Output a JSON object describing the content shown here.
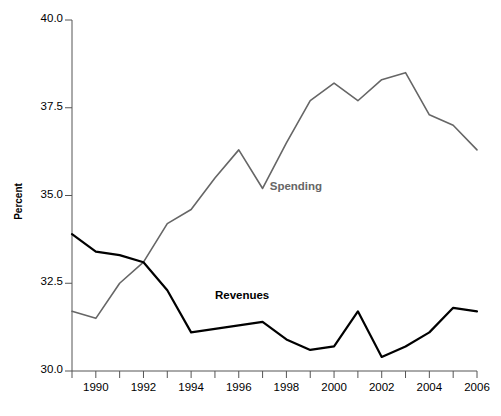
{
  "chart_data": {
    "type": "line",
    "title": "",
    "xlabel": "",
    "ylabel": "Percent",
    "ylim": [
      30.0,
      40.0
    ],
    "xlim": [
      1989,
      2006
    ],
    "grid": false,
    "legend_position": "inline-annotation",
    "ytick_labels": [
      "40.0",
      "37.5",
      "35.0",
      "32.5",
      "30.0"
    ],
    "ytick_values": [
      40.0,
      37.5,
      35.0,
      32.5,
      30.0
    ],
    "xtick_labels": [
      "1990",
      "1992",
      "1994",
      "1996",
      "1998",
      "2000",
      "2002",
      "2004",
      "2006"
    ],
    "xtick_values": [
      1990,
      1992,
      1994,
      1996,
      1998,
      2000,
      2002,
      2004,
      2006
    ],
    "x": [
      1989,
      1990,
      1991,
      1992,
      1993,
      1994,
      1995,
      1996,
      1997,
      1998,
      1999,
      2000,
      2001,
      2002,
      2003,
      2004,
      2005,
      2006
    ],
    "series": [
      {
        "name": "Spending",
        "color": "#666666",
        "label_color": "#666666",
        "values": [
          31.7,
          31.5,
          32.5,
          33.1,
          34.2,
          34.6,
          35.5,
          36.3,
          35.2,
          36.5,
          37.7,
          38.2,
          37.7,
          38.3,
          38.5,
          37.3,
          37.0,
          36.3
        ]
      },
      {
        "name": "Revenues",
        "color": "#000000",
        "label_color": "#000000",
        "values": [
          33.9,
          33.4,
          33.3,
          33.1,
          32.3,
          31.1,
          31.2,
          31.3,
          31.4,
          30.9,
          30.6,
          30.7,
          31.7,
          30.4,
          30.7,
          31.1,
          31.8,
          31.7
        ]
      }
    ],
    "annotations": [
      {
        "text": "Spending",
        "x": 1997.3,
        "y": 35.2,
        "color": "#666666"
      },
      {
        "text": "Revenues",
        "x": 1995.0,
        "y": 32.1,
        "color": "#000000"
      }
    ]
  },
  "axes": {
    "axis_color": "#555555",
    "background": "#ffffff"
  }
}
